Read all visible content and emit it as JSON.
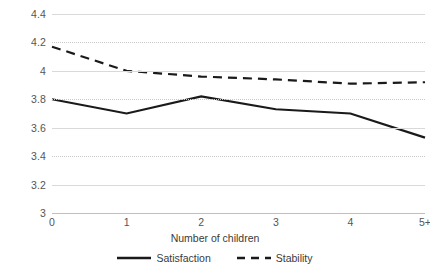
{
  "chart_data": {
    "type": "line",
    "title": "",
    "xlabel": "Number of children",
    "ylabel": "",
    "categories": [
      "0",
      "1",
      "2",
      "3",
      "4",
      "5+"
    ],
    "ylim": [
      3,
      4.4
    ],
    "ytick_labels": [
      "4.4",
      "4.2",
      "4",
      "3.8",
      "3.6",
      "3.4",
      "3.2",
      "3"
    ],
    "ytick_values": [
      4.4,
      4.2,
      4.0,
      3.8,
      3.6,
      3.4,
      3.2,
      3.0
    ],
    "grid": true,
    "grid_axis": "y",
    "legend_position": "bottom",
    "series": [
      {
        "name": "Satisfaction",
        "style": "solid",
        "color": "#1a1a1a",
        "values": [
          3.8,
          3.7,
          3.82,
          3.73,
          3.7,
          3.53
        ]
      },
      {
        "name": "Stability",
        "style": "dashed",
        "color": "#1a1a1a",
        "values": [
          4.17,
          4.0,
          3.96,
          3.94,
          3.91,
          3.92
        ]
      }
    ]
  },
  "colors": {
    "gridline_solid": "#d9d9d9",
    "gridline_dotted": "#c9c9c9",
    "axis": "#bfbfbf",
    "tick_text": "#555555",
    "label_text": "#3a3a3a"
  }
}
